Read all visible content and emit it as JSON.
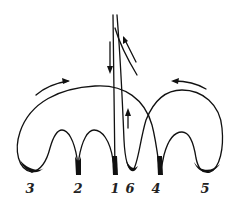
{
  "figure": {
    "labels": [
      {
        "id": "cusp-3",
        "text": "3",
        "x": 30,
        "y": 183
      },
      {
        "id": "cusp-2",
        "text": "2",
        "x": 78,
        "y": 183
      },
      {
        "id": "cusp-1",
        "text": "1",
        "x": 115,
        "y": 183
      },
      {
        "id": "cusp-6",
        "text": "6",
        "x": 130,
        "y": 183
      },
      {
        "id": "cusp-4",
        "text": "4",
        "x": 156,
        "y": 183
      },
      {
        "id": "cusp-5",
        "text": "5",
        "x": 205,
        "y": 183
      }
    ],
    "arrows": [
      {
        "id": "arrow-left-top",
        "direction": "right"
      },
      {
        "id": "arrow-right-top",
        "direction": "left"
      },
      {
        "id": "arrow-vertical-down",
        "direction": "down"
      },
      {
        "id": "arrow-vertical-up",
        "direction": "up"
      },
      {
        "id": "arrow-diagonal-up",
        "direction": "up-left"
      }
    ],
    "colors": {
      "ink": "#111111",
      "background": "#ffffff"
    }
  }
}
